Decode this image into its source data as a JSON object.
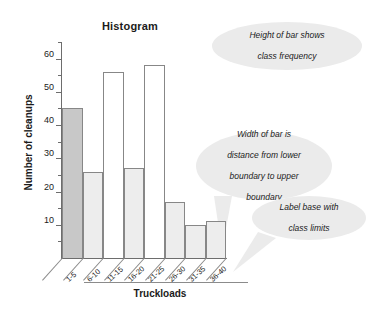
{
  "chart_data": {
    "type": "bar",
    "title": "Histogram",
    "xlabel": "Truckloads",
    "ylabel": "Number of cleanups",
    "categories": [
      "1-5",
      "6-10",
      "11-15",
      "16-20",
      "21-25",
      "26-30",
      "31-35",
      "36-40"
    ],
    "values": [
      45,
      26,
      56,
      27,
      58,
      17,
      10,
      11
    ],
    "ylim": [
      0,
      65
    ],
    "y_major_ticks": [
      10,
      20,
      30,
      40,
      50,
      60
    ],
    "y_minor_ticks": [
      5,
      15,
      25,
      35,
      45,
      55,
      65
    ],
    "y_tick_labels": [
      "10",
      "20",
      "30",
      "40",
      "50",
      "60"
    ],
    "grid": false,
    "legend": "none",
    "bar_fills": [
      "#c8c8c8",
      "#ededed",
      "#ffffff",
      "#ededed",
      "#ffffff",
      "#ededed",
      "#ededed",
      "#ededed"
    ],
    "bar_border_color": "#878787",
    "highlight_bar_index": 0,
    "annotations": [
      "Height of bar shows class frequency",
      "Width of  bar is distance from lower boundary to upper boundary",
      "Label base with class limits"
    ]
  },
  "callouts": {
    "height_of_bar": {
      "line1": "Height of bar shows",
      "line2": "class frequency"
    },
    "width_of_bar": {
      "line1": "Width of  bar is",
      "line2": "distance from lower",
      "line3": "boundary to upper",
      "line4": "boundary"
    },
    "label_base": {
      "line1": "Label base with",
      "line2": "class limits"
    }
  },
  "colors": {
    "callout_fill": "#ebebeb",
    "axis": "#6d6d6d",
    "text": "#1b1b1b",
    "highlight_bar": "#c8c8c8",
    "light_bar": "#ededed",
    "white_bar": "#ffffff"
  }
}
